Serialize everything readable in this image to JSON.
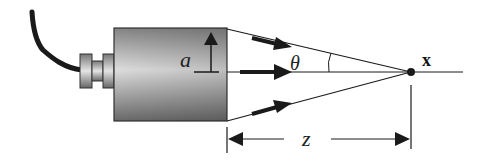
{
  "diagram": {
    "labels": {
      "aperture": "a",
      "angle": "θ",
      "focal_point": "x",
      "distance": "z"
    },
    "colors": {
      "line": "#1a1a1a",
      "body_light": "#e6e6e6",
      "body_dark": "#7a7a7a",
      "background": "#ffffff"
    },
    "components": [
      "cable",
      "connector",
      "transducer-body",
      "aperture-arrow",
      "beam-rays",
      "axis-line",
      "focal-point",
      "distance-dimension"
    ]
  }
}
